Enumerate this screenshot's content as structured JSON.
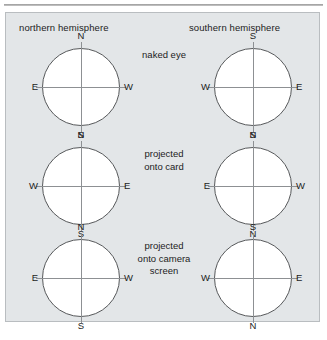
{
  "figure": {
    "background_color": "#e3e6e8",
    "border_color": "#b9bdc0",
    "circle_stroke": "#57595b",
    "axis_stroke": "#8d9093",
    "text_color": "#1c1c1c",
    "headers": {
      "left": "northern hemisphere",
      "right": "southern hemisphere"
    },
    "rows": [
      {
        "center_label": "naked eye",
        "left": {
          "north_position": "N",
          "south_position": "S",
          "west_position": "E",
          "east_position": "W"
        },
        "right": {
          "north_position": "S",
          "south_position": "N",
          "west_position": "W",
          "east_position": "E"
        }
      },
      {
        "center_label": "projected\nonto card",
        "left": {
          "north_position": "N",
          "south_position": "S",
          "west_position": "W",
          "east_position": "E"
        },
        "right": {
          "north_position": "S",
          "south_position": "N",
          "west_position": "E",
          "east_position": "W"
        }
      },
      {
        "center_label": "projected\nonto camera\nscreen",
        "left": {
          "north_position": "N",
          "south_position": "S",
          "west_position": "E",
          "east_position": "W"
        },
        "right": {
          "north_position": "S",
          "south_position": "N",
          "west_position": "W",
          "east_position": "E"
        }
      }
    ],
    "caption": ""
  }
}
